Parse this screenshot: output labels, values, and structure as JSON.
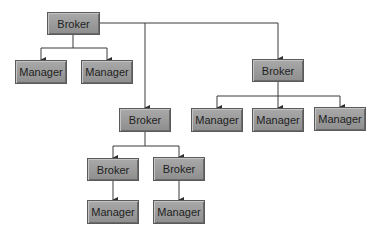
{
  "diagram": {
    "type": "hierarchy",
    "line_color": "#3a3a3a",
    "node_fill": "#9c9c9c",
    "nodes": [
      {
        "id": "n1",
        "label": "Broker",
        "x": 47,
        "y": 12,
        "w": 53,
        "h": 23
      },
      {
        "id": "n2",
        "label": "Manager",
        "x": 15,
        "y": 60,
        "w": 52,
        "h": 24
      },
      {
        "id": "n3",
        "label": "Manager",
        "x": 81,
        "y": 60,
        "w": 52,
        "h": 24
      },
      {
        "id": "n4",
        "label": "Broker",
        "x": 252,
        "y": 59,
        "w": 52,
        "h": 23
      },
      {
        "id": "n5",
        "label": "Manager",
        "x": 191,
        "y": 108,
        "w": 52,
        "h": 24
      },
      {
        "id": "n6",
        "label": "Manager",
        "x": 252,
        "y": 108,
        "w": 52,
        "h": 24
      },
      {
        "id": "n7",
        "label": "Manager",
        "x": 314,
        "y": 107,
        "w": 52,
        "h": 24
      },
      {
        "id": "n8",
        "label": "Broker",
        "x": 119,
        "y": 108,
        "w": 52,
        "h": 24
      },
      {
        "id": "n9",
        "label": "Broker",
        "x": 87,
        "y": 158,
        "w": 52,
        "h": 23
      },
      {
        "id": "n10",
        "label": "Broker",
        "x": 153,
        "y": 157,
        "w": 52,
        "h": 24
      },
      {
        "id": "n11",
        "label": "Manager",
        "x": 87,
        "y": 200,
        "w": 52,
        "h": 24
      },
      {
        "id": "n12",
        "label": "Manager",
        "x": 153,
        "y": 200,
        "w": 52,
        "h": 24
      }
    ],
    "edges": [
      [
        "n1",
        "n2"
      ],
      [
        "n1",
        "n3"
      ],
      [
        "n1",
        "n4"
      ],
      [
        "n1",
        "n8"
      ],
      [
        "n4",
        "n5"
      ],
      [
        "n4",
        "n6"
      ],
      [
        "n4",
        "n7"
      ],
      [
        "n8",
        "n9"
      ],
      [
        "n8",
        "n10"
      ],
      [
        "n9",
        "n11"
      ],
      [
        "n10",
        "n12"
      ]
    ]
  }
}
